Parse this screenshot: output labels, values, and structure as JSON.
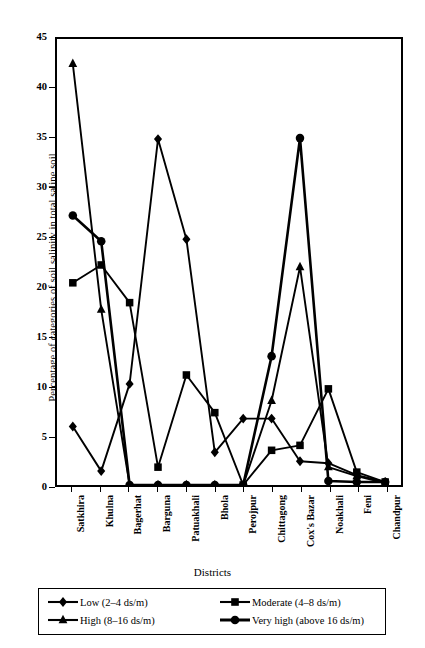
{
  "chart_data": {
    "type": "line",
    "title": "",
    "xlabel": "Districts",
    "ylabel": "Percentage of categories of soil salinity in total saline soil",
    "ylim": [
      0,
      45
    ],
    "yticks": [
      0,
      5,
      10,
      15,
      20,
      25,
      30,
      35,
      40,
      45
    ],
    "grid": false,
    "legend_position": "bottom",
    "categories": [
      "Satkhira",
      "Khulna",
      "Bagerhat",
      "Barguna",
      "Patuakhali",
      "Bhola",
      "Perojpur",
      "Chittagong",
      "Cox's Bazar",
      "Noakhali",
      "Feni",
      "Chandpur"
    ],
    "series": [
      {
        "name": "Low (2–4 ds/m)",
        "marker": "diamond",
        "values": [
          5.9,
          1.4,
          10.2,
          34.9,
          24.8,
          3.3,
          6.7,
          6.7,
          2.4,
          2.2,
          1.0,
          0.3
        ]
      },
      {
        "name": "Moderate (4–8 ds/m)",
        "marker": "square",
        "values": [
          20.4,
          22.2,
          18.4,
          1.8,
          11.1,
          7.3,
          0.0,
          3.5,
          4.0,
          9.7,
          1.3,
          0.3
        ]
      },
      {
        "name": "High (8–16 ds/m)",
        "marker": "triangle",
        "values": [
          42.5,
          17.7,
          0.0,
          0.0,
          0.0,
          0.0,
          0.0,
          8.5,
          22.0,
          1.8,
          0.9,
          0.2
        ]
      },
      {
        "name": "Very high (above 16 ds/m)",
        "marker": "circle",
        "values": [
          27.2,
          24.6,
          0.0,
          0.0,
          0.0,
          0.0,
          0.0,
          13.0,
          35.0,
          0.4,
          0.3,
          0.3
        ]
      }
    ]
  },
  "axis": {
    "y_title": "Percentage of categories of soil salinity in total saline soil",
    "x_title": "Districts",
    "y_tick_labels": [
      "0",
      "5",
      "10",
      "15",
      "20",
      "25",
      "30",
      "35",
      "40",
      "45"
    ],
    "x_tick_labels": [
      "Satkhira",
      "Khulna",
      "Bagerhat",
      "Barguna",
      "Patuakhali",
      "Bhola",
      "Perojpur",
      "Chittagong",
      "Cox's Bazar",
      "Noakhali",
      "Feni",
      "Chandpur"
    ]
  },
  "legend": {
    "entries": [
      {
        "label": "Low (2–4 ds/m)",
        "marker": "diamond"
      },
      {
        "label": "Moderate (4–8 ds/m)",
        "marker": "square"
      },
      {
        "label": "High (8–16 ds/m)",
        "marker": "triangle"
      },
      {
        "label": "Very high (above 16 ds/m)",
        "marker": "circle"
      }
    ]
  },
  "colors": {
    "ink": "#000000",
    "paper": "#ffffff"
  }
}
